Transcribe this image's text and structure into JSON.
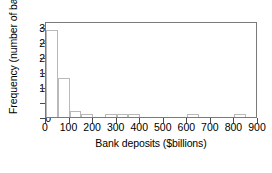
{
  "chart_data": {
    "type": "bar",
    "title": "",
    "subtitle": "",
    "xlabel": "Bank deposits ($billions)",
    "ylabel": "Frequency (number of banks)",
    "xlim": [
      0,
      900
    ],
    "ylim": [
      0,
      32
    ],
    "grid": false,
    "legend": null,
    "bin_width": 50,
    "x_ticks": [
      0,
      100,
      200,
      300,
      400,
      500,
      600,
      700,
      800,
      900
    ],
    "x_tick_labels": [
      "0",
      "100",
      "200",
      "300",
      "400",
      "500",
      "600",
      "700",
      "800",
      "900"
    ],
    "y_ticks": [
      0,
      5,
      10,
      15,
      20,
      25,
      30
    ],
    "y_tick_labels": [
      "0",
      "5",
      "10",
      "15",
      "20",
      "25",
      "30"
    ],
    "bins": [
      {
        "start": 0,
        "end": 50,
        "value": 29
      },
      {
        "start": 50,
        "end": 100,
        "value": 13
      },
      {
        "start": 100,
        "end": 150,
        "value": 2
      },
      {
        "start": 150,
        "end": 200,
        "value": 1
      },
      {
        "start": 200,
        "end": 250,
        "value": 0
      },
      {
        "start": 250,
        "end": 300,
        "value": 1
      },
      {
        "start": 300,
        "end": 350,
        "value": 1
      },
      {
        "start": 350,
        "end": 400,
        "value": 1
      },
      {
        "start": 400,
        "end": 450,
        "value": 0
      },
      {
        "start": 450,
        "end": 500,
        "value": 0
      },
      {
        "start": 500,
        "end": 550,
        "value": 0
      },
      {
        "start": 550,
        "end": 600,
        "value": 0
      },
      {
        "start": 600,
        "end": 650,
        "value": 1
      },
      {
        "start": 650,
        "end": 700,
        "value": 0
      },
      {
        "start": 700,
        "end": 750,
        "value": 0
      },
      {
        "start": 750,
        "end": 800,
        "value": 0
      },
      {
        "start": 800,
        "end": 850,
        "value": 1
      },
      {
        "start": 850,
        "end": 900,
        "value": 0
      }
    ],
    "categories": [
      "0-50",
      "50-100",
      "100-150",
      "150-200",
      "200-250",
      "250-300",
      "300-350",
      "350-400",
      "400-450",
      "450-500",
      "500-550",
      "550-600",
      "600-650",
      "650-700",
      "700-750",
      "750-800",
      "800-850",
      "850-900"
    ],
    "values": [
      29,
      13,
      2,
      1,
      0,
      1,
      1,
      1,
      0,
      0,
      0,
      0,
      1,
      0,
      0,
      0,
      1,
      0
    ],
    "colors": {
      "bar_fill": "#ffffff",
      "bar_edge": "#b9b9b9",
      "axis": "#7a7a7a",
      "text": "#000000",
      "background": "#ffffff"
    }
  },
  "caption": {
    "text": ""
  }
}
